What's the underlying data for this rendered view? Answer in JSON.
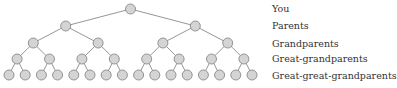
{
  "diagram": {
    "type": "binary-family-tree",
    "node_fill": "#d4d4d4",
    "node_stroke": "#8a8a8a",
    "edge_color": "#8a8a8a",
    "levels": [
      {
        "label": "You",
        "count": 1
      },
      {
        "label": "Parents",
        "count": 2
      },
      {
        "label": "Grandparents",
        "count": 4
      },
      {
        "label": "Great-grandparents",
        "count": 8
      },
      {
        "label": "Great-great-grandparents",
        "count": 16
      }
    ]
  }
}
